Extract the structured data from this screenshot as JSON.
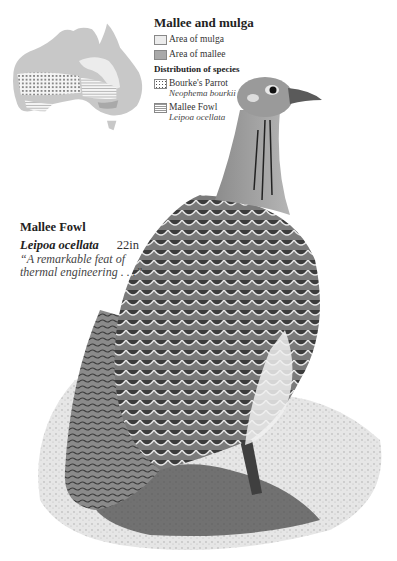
{
  "legend": {
    "title": "Mallee and mulga",
    "items": [
      {
        "label": "Area of mulga",
        "swatch": "light-grey"
      },
      {
        "label": "Area of mallee",
        "swatch": "mid-grey"
      }
    ],
    "subtitle": "Distribution of species",
    "species": [
      {
        "label": "Bourke's Parrot",
        "latin": "Neophema bourkii",
        "swatch": "dotted"
      },
      {
        "label": "Mallee Fowl",
        "latin": "Leipoa ocellata",
        "swatch": "hatched"
      }
    ]
  },
  "caption": {
    "name": "Mallee Fowl",
    "latin": "Leipoa ocellata",
    "size": "22in",
    "quote_line1": "“A remarkable feat of",
    "quote_line2": "thermal engineering . . .”"
  },
  "colors": {
    "map_base": "#c8c8c8",
    "mulga": "#ececec",
    "mallee": "#a9a9a9",
    "ink": "#222222"
  }
}
